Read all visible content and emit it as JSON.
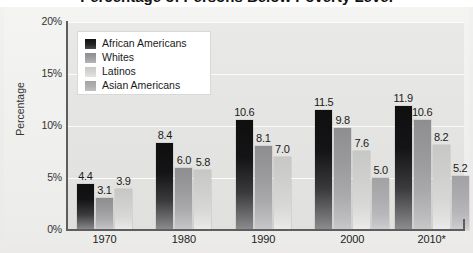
{
  "figure": {
    "title_partial": "Percentage of Persons Below Poverty Level",
    "ylabel": "Percentage"
  },
  "legend": {
    "items": [
      {
        "label": "African Americans",
        "swatch": "legend-swatch-african-americans",
        "color": "#141416"
      },
      {
        "label": "Whites",
        "swatch": "legend-swatch-whites",
        "color": "#9a9a9c"
      },
      {
        "label": "Latinos",
        "swatch": "legend-swatch-latinos",
        "color": "#d6d6d5"
      },
      {
        "label": "Asian Americans",
        "swatch": "legend-swatch-asian-americans",
        "color": "#b0b0b2"
      }
    ]
  },
  "axes": {
    "yticks": [
      "0%",
      "5%",
      "10%",
      "15%",
      "20%"
    ],
    "xticks": [
      "1970",
      "1980",
      "1990",
      "2000",
      "2010*"
    ]
  },
  "chart_data": {
    "type": "bar",
    "title": "Percentage of Persons Below Poverty Level",
    "xlabel": "",
    "ylabel": "Percentage",
    "ylim": [
      0,
      20
    ],
    "ytick_values": [
      0,
      5,
      10,
      15,
      20
    ],
    "ytick_labels": [
      "0%",
      "5%",
      "10%",
      "15%",
      "20%"
    ],
    "grid": true,
    "legend_position": "upper-left-inset",
    "categories": [
      "1970",
      "1980",
      "1990",
      "2000",
      "2010*"
    ],
    "series": [
      {
        "name": "African Americans",
        "values": [
          4.4,
          8.4,
          10.6,
          11.5,
          11.9
        ]
      },
      {
        "name": "Whites",
        "values": [
          3.1,
          6.0,
          8.1,
          9.8,
          10.6
        ]
      },
      {
        "name": "Latinos",
        "values": [
          3.9,
          5.8,
          7.0,
          7.6,
          8.2
        ]
      },
      {
        "name": "Asian Americans",
        "values": [
          null,
          null,
          null,
          5.0,
          5.2
        ]
      }
    ],
    "data_labels": [
      [
        "4.4",
        "3.1",
        "3.9"
      ],
      [
        "8.4",
        "6.0",
        "5.8"
      ],
      [
        "10.6",
        "8.1",
        "7.0"
      ],
      [
        "11.5",
        "9.8",
        "7.6",
        "5.0"
      ],
      [
        "11.9",
        "10.6",
        "8.2",
        "5.2"
      ]
    ],
    "note": "2010 marked with asterisk"
  }
}
